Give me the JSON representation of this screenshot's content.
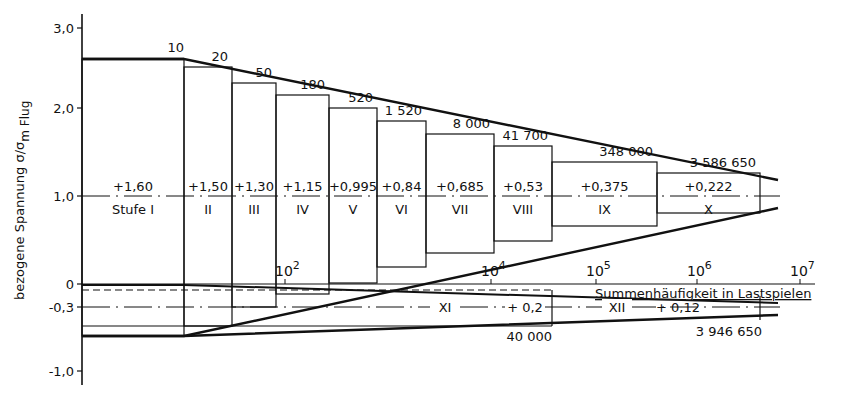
{
  "chart_data": {
    "type": "line",
    "title": "",
    "ylabel": "bezogene Spannung σ/σmFlug",
    "ylabel_main": "bezogene Spannung σ/σ",
    "ylabel_sub": "m Flug",
    "xlabel": "Summenhäufigkeit in Lastspielen",
    "yticks": [
      {
        "value": 3.0,
        "label": "3,0",
        "px": 28
      },
      {
        "value": 2.0,
        "label": "2,0",
        "px": 108
      },
      {
        "value": 1.0,
        "label": "1,0",
        "px": 196
      },
      {
        "value": 0.0,
        "label": "0",
        "px": 284
      },
      {
        "value": -0.3,
        "label": "-0,3",
        "px": 307
      },
      {
        "value": -1.0,
        "label": "-1,0",
        "px": 371
      }
    ],
    "xticks": [
      {
        "label_base": "10",
        "label_exp": "2",
        "px": 285
      },
      {
        "label_base": "10",
        "label_exp": "4",
        "px": 491
      },
      {
        "label_base": "10",
        "label_exp": "5",
        "px": 596
      },
      {
        "label_base": "10",
        "label_exp": "6",
        "px": 697
      },
      {
        "label_base": "10",
        "label_exp": "7",
        "px": 800
      }
    ],
    "ylim": [
      -1.0,
      3.0
    ],
    "grid": false,
    "steps": [
      {
        "stage": "Stufe I",
        "amplitude": "+1,60",
        "cumulative_cycles": "10",
        "x0": 82,
        "x1": 184,
        "upper": 259,
        "lower": 336
      },
      {
        "stage": "II",
        "amplitude": "+1,50",
        "cumulative_cycles": "20",
        "x0": 184,
        "x1": 232,
        "upper": 67,
        "lower": 326
      },
      {
        "stage": "III",
        "amplitude": "+1,30",
        "cumulative_cycles": "50",
        "x0": 232,
        "x1": 276,
        "upper": 83,
        "lower": 307
      },
      {
        "stage": "IV",
        "amplitude": "+1,15",
        "cumulative_cycles": "180",
        "x0": 276,
        "x1": 329,
        "upper": 95,
        "lower": 294
      },
      {
        "stage": "V",
        "amplitude": "+0,995",
        "cumulative_cycles": "520",
        "x0": 329,
        "x1": 377,
        "upper": 108,
        "lower": 283
      },
      {
        "stage": "VI",
        "amplitude": "+0,84",
        "cumulative_cycles": "1 520",
        "x0": 377,
        "x1": 426,
        "upper": 121,
        "lower": 267
      },
      {
        "stage": "VII",
        "amplitude": "+0,685",
        "cumulative_cycles": "8 000",
        "x0": 426,
        "x1": 494,
        "upper": 134,
        "lower": 253
      },
      {
        "stage": "VIII",
        "amplitude": "+0,53",
        "cumulative_cycles": "41 700",
        "x0": 494,
        "x1": 552,
        "upper": 146,
        "lower": 241
      },
      {
        "stage": "IX",
        "amplitude": "+0,375",
        "cumulative_cycles": "348 000",
        "x0": 552,
        "x1": 657,
        "upper": 162,
        "lower": 226
      },
      {
        "stage": "X",
        "amplitude": "+0,222",
        "cumulative_cycles": "3 586 650",
        "x0": 657,
        "x1": 760,
        "upper": 173,
        "lower": 213
      }
    ],
    "ground_steps": [
      {
        "stage": "XI",
        "amplitude": "+0.2",
        "cumulative_cycles": "40 000"
      },
      {
        "stage": "XII",
        "amplitude": "+0.12",
        "cumulative_cycles": "3 946 650"
      }
    ],
    "envelope_upper": [
      [
        82,
        59
      ],
      [
        184,
        59
      ],
      [
        778,
        180
      ]
    ],
    "envelope_lower": [
      [
        82,
        336
      ],
      [
        184,
        336
      ],
      [
        778,
        208
      ]
    ],
    "mean_line_y": 196,
    "zero_line_y": 284,
    "minus03_line_y": 307,
    "ground_upper": [
      [
        82,
        285
      ],
      [
        184,
        285
      ],
      [
        778,
        303
      ]
    ],
    "ground_lower": [
      [
        82,
        336
      ],
      [
        184,
        336
      ],
      [
        778,
        315
      ]
    ],
    "legend": null
  },
  "labels": {
    "ground_xi": "XI",
    "ground_xi_amp": "+ 0,2",
    "ground_xii": "XII",
    "ground_xii_amp": "+ 0,12",
    "ground_count_1": "40 000",
    "ground_count_2": "3 946 650"
  }
}
